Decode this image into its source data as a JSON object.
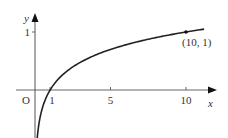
{
  "chart_data": {
    "type": "line",
    "title": "",
    "function": "y = log10(x)",
    "xlabel": "x",
    "ylabel": "y",
    "origin_label": "O",
    "x_ticks": [
      {
        "value": 1,
        "label": "1"
      },
      {
        "value": 5,
        "label": "5"
      },
      {
        "value": 10,
        "label": "10"
      }
    ],
    "y_ticks": [
      {
        "value": 1,
        "label": "1"
      }
    ],
    "annotated_point": {
      "x": 10,
      "y": 1,
      "label": "(10, 1)"
    },
    "series": [
      {
        "name": "curve",
        "x": [
          0.25,
          0.4,
          0.6,
          0.8,
          1,
          1.5,
          2,
          3,
          4,
          5,
          6,
          7,
          8,
          9,
          10,
          11.2
        ],
        "y": [
          -0.602,
          -0.398,
          -0.222,
          -0.097,
          0,
          0.176,
          0.301,
          0.477,
          0.602,
          0.699,
          0.778,
          0.845,
          0.903,
          0.954,
          1,
          1.049
        ]
      }
    ],
    "xlim": [
      -2,
      12.5
    ],
    "ylim": [
      -0.7,
      1.3
    ],
    "grid": false,
    "legend": "none"
  },
  "colors": {
    "axis": "#555555",
    "curve": "#222222",
    "text": "#333333"
  }
}
